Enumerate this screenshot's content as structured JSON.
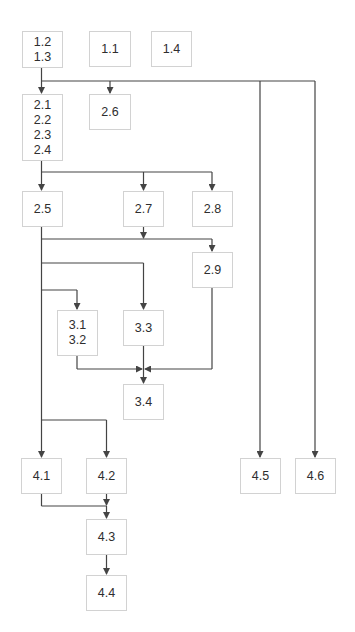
{
  "diagram": {
    "type": "dependency-flowchart",
    "colors": {
      "line": "#444444",
      "box_border": "#d2d2d2",
      "text": "#2e2e2e",
      "background": "#ffffff"
    },
    "nodes": [
      {
        "id": "n12_13",
        "label": "1.2\n1.3",
        "x": 22,
        "y": 31,
        "w": 41,
        "h": 37
      },
      {
        "id": "n11",
        "label": "1.1",
        "x": 89,
        "y": 31,
        "w": 42,
        "h": 36
      },
      {
        "id": "n14",
        "label": "1.4",
        "x": 151,
        "y": 31,
        "w": 41,
        "h": 36
      },
      {
        "id": "n21_24",
        "label": "2.1\n2.2\n2.3\n2.4",
        "x": 22,
        "y": 94,
        "w": 41,
        "h": 67
      },
      {
        "id": "n26",
        "label": "2.6",
        "x": 89,
        "y": 94,
        "w": 42,
        "h": 36
      },
      {
        "id": "n25",
        "label": "2.5",
        "x": 22,
        "y": 191,
        "w": 41,
        "h": 36
      },
      {
        "id": "n27",
        "label": "2.7",
        "x": 123,
        "y": 191,
        "w": 41,
        "h": 36
      },
      {
        "id": "n28",
        "label": "2.8",
        "x": 192,
        "y": 191,
        "w": 41,
        "h": 36
      },
      {
        "id": "n29",
        "label": "2.9",
        "x": 192,
        "y": 252,
        "w": 41,
        "h": 36
      },
      {
        "id": "n31_32",
        "label": "3.1\n3.2",
        "x": 57,
        "y": 310,
        "w": 41,
        "h": 46
      },
      {
        "id": "n33",
        "label": "3.3",
        "x": 123,
        "y": 310,
        "w": 41,
        "h": 36
      },
      {
        "id": "n34",
        "label": "3.4",
        "x": 123,
        "y": 384,
        "w": 41,
        "h": 36
      },
      {
        "id": "n41",
        "label": "4.1",
        "x": 21,
        "y": 458,
        "w": 41,
        "h": 36
      },
      {
        "id": "n42",
        "label": "4.2",
        "x": 86,
        "y": 458,
        "w": 41,
        "h": 36
      },
      {
        "id": "n45",
        "label": "4.5",
        "x": 240,
        "y": 458,
        "w": 41,
        "h": 36
      },
      {
        "id": "n46",
        "label": "4.6",
        "x": 295,
        "y": 458,
        "w": 41,
        "h": 36
      },
      {
        "id": "n43",
        "label": "4.3",
        "x": 86,
        "y": 519,
        "w": 41,
        "h": 36
      },
      {
        "id": "n44",
        "label": "4.4",
        "x": 86,
        "y": 575,
        "w": 41,
        "h": 36
      }
    ],
    "edges": [
      {
        "from": "1.2/1.3",
        "to": "2.1-2.4"
      },
      {
        "from": "1.2/1.3",
        "to": "2.6"
      },
      {
        "from": "1.2/1.3",
        "to": "4.5"
      },
      {
        "from": "1.2/1.3",
        "to": "4.6"
      },
      {
        "from": "2.1-2.4",
        "to": "2.5"
      },
      {
        "from": "2.1-2.4",
        "to": "2.7"
      },
      {
        "from": "2.1-2.4",
        "to": "2.8"
      },
      {
        "from": "2.5",
        "to": "2.9"
      },
      {
        "from": "2.7",
        "to": "2.9"
      },
      {
        "from": "2.5",
        "to": "3.3"
      },
      {
        "from": "2.5",
        "to": "3.1/3.2"
      },
      {
        "from": "3.1/3.2",
        "to": "3.4"
      },
      {
        "from": "3.3",
        "to": "3.4"
      },
      {
        "from": "2.9",
        "to": "3.4"
      },
      {
        "from": "2.5",
        "to": "4.1"
      },
      {
        "from": "2.5",
        "to": "4.2"
      },
      {
        "from": "4.1",
        "to": "4.3"
      },
      {
        "from": "4.2",
        "to": "4.3"
      },
      {
        "from": "4.3",
        "to": "4.4"
      }
    ]
  }
}
